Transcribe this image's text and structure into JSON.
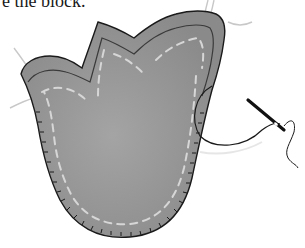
{
  "caption": {
    "text": "e the block."
  },
  "illustration": {
    "subject": "tulip-appliqué-block-being-stitched",
    "colors": {
      "fabric": "#8f8f8f",
      "fabric_light": "#a3a3a3",
      "outline": "#1a1a1a",
      "basting": "#d6d6d6",
      "loose_thread": "#c8c8c8",
      "needle": "#111111"
    }
  }
}
